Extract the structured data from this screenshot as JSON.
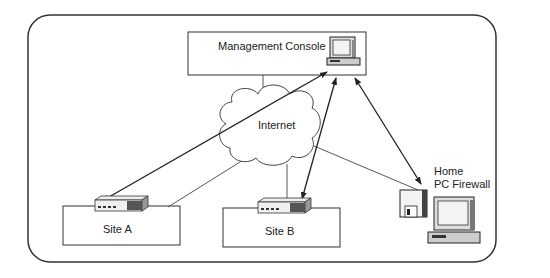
{
  "diagram": {
    "title": "",
    "nodes": {
      "management_console": {
        "label": "Management Console",
        "icon": "desktop-computer-icon"
      },
      "internet": {
        "label": "Internet",
        "icon": "cloud-icon"
      },
      "site_a": {
        "label": "Site A",
        "icon": "firewall-appliance-icon"
      },
      "site_b": {
        "label": "Site B",
        "icon": "firewall-appliance-icon"
      },
      "home_pc": {
        "label_line1": "Home",
        "label_line2": "PC Firewall",
        "icon": "pc-with-floppy-disk-icon"
      }
    },
    "edges": [
      {
        "from": "management_console",
        "to": "site_a",
        "type": "bidirectional-arrow"
      },
      {
        "from": "management_console",
        "to": "site_b",
        "type": "bidirectional-arrow"
      },
      {
        "from": "management_console",
        "to": "home_pc",
        "type": "bidirectional-arrow"
      },
      {
        "from": "internet",
        "to": "management_console",
        "type": "line"
      },
      {
        "from": "internet",
        "to": "site_a",
        "type": "line"
      },
      {
        "from": "internet",
        "to": "site_b",
        "type": "line"
      },
      {
        "from": "internet",
        "to": "home_pc",
        "type": "line"
      }
    ],
    "colors": {
      "stroke": "#222222",
      "fill": "#ffffff",
      "device_gray": "#bbbbbb"
    }
  }
}
